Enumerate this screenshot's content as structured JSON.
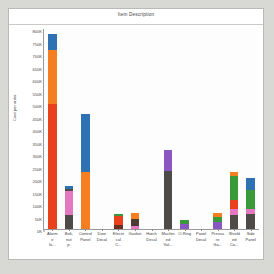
{
  "chart_data": {
    "type": "bar",
    "stacked": true,
    "title": "Item Description",
    "xlabel": "",
    "ylabel": "Cost per order",
    "ylim": [
      0,
      800000
    ],
    "ytick_labels": [
      "0K",
      "50K",
      "100K",
      "150K",
      "200K",
      "250K",
      "300K",
      "350K",
      "400K",
      "450K",
      "500K",
      "550K",
      "600K",
      "650K",
      "700K",
      "750K",
      "800K"
    ],
    "ytick_values": [
      0,
      50000,
      100000,
      150000,
      200000,
      250000,
      300000,
      350000,
      400000,
      450000,
      500000,
      550000,
      600000,
      650000,
      700000,
      750000,
      800000
    ],
    "grid": false,
    "legend": "none",
    "categories": [
      "Alarm e fa...",
      "Bolt, nut p.",
      "Control Panel",
      "Door Decal",
      "Electri cal C...",
      "Gasket",
      "Hatch Decal",
      "Machin ed Val...",
      "O-Ring",
      "Panel Decal",
      "Pressu re Ga...",
      "Shield ed Ca...",
      "Side Panel"
    ],
    "colors": {
      "blue": "#2f72b4",
      "orange": "#f57f20",
      "red": "#e8411c",
      "pink": "#e377c2",
      "gray": "#4d4a47",
      "green": "#3a9a3a",
      "purple": "#8a56c2",
      "teal": "#17becf"
    },
    "bars": [
      {
        "category": "Alarm e fa...",
        "total": 780000,
        "segments": [
          {
            "color": "#e8411c",
            "value": 500000
          },
          {
            "color": "#f57f20",
            "value": 215000
          },
          {
            "color": "#2f72b4",
            "value": 65000
          }
        ]
      },
      {
        "category": "Bolt, nut p.",
        "total": 172000,
        "segments": [
          {
            "color": "#4d4a47",
            "value": 55000
          },
          {
            "color": "#e377c2",
            "value": 98000
          },
          {
            "color": "#4d4a47",
            "value": 8000
          },
          {
            "color": "#2f72b4",
            "value": 11000
          }
        ]
      },
      {
        "category": "Control Panel",
        "total": 462000,
        "segments": [
          {
            "color": "#f57f20",
            "value": 228000
          },
          {
            "color": "#2f72b4",
            "value": 234000
          }
        ]
      },
      {
        "category": "Door Decal",
        "total": 0,
        "segments": []
      },
      {
        "category": "Electri cal C...",
        "total": 61000,
        "segments": [
          {
            "color": "#6b2f22",
            "value": 18000
          },
          {
            "color": "#e8411c",
            "value": 34000
          },
          {
            "color": "#3a9a3a",
            "value": 9000
          }
        ]
      },
      {
        "category": "Gasket",
        "total": 66000,
        "segments": [
          {
            "color": "#e377c2",
            "value": 14000
          },
          {
            "color": "#4d3a32",
            "value": 26000
          },
          {
            "color": "#f57f20",
            "value": 26000
          }
        ]
      },
      {
        "category": "Hatch Decal",
        "total": 0,
        "segments": []
      },
      {
        "category": "Machin ed Val...",
        "total": 318000,
        "segments": [
          {
            "color": "#4d4a47",
            "value": 234000
          },
          {
            "color": "#8a56c2",
            "value": 84000
          }
        ]
      },
      {
        "category": "O-Ring",
        "total": 38000,
        "segments": [
          {
            "color": "#8a56c2",
            "value": 22000
          },
          {
            "color": "#3a9a3a",
            "value": 16000
          }
        ]
      },
      {
        "category": "Panel Decal",
        "total": 0,
        "segments": []
      },
      {
        "category": "Pressu re Ga...",
        "total": 63000,
        "segments": [
          {
            "color": "#8a56c2",
            "value": 28000
          },
          {
            "color": "#3a9a3a",
            "value": 22000
          },
          {
            "color": "#f57f20",
            "value": 13000
          }
        ]
      },
      {
        "category": "Shield ed Ca...",
        "total": 228000,
        "segments": [
          {
            "color": "#4d4a47",
            "value": 57000
          },
          {
            "color": "#e377c2",
            "value": 24000
          },
          {
            "color": "#e8411c",
            "value": 34000
          },
          {
            "color": "#3a9a3a",
            "value": 99000
          },
          {
            "color": "#f57f20",
            "value": 14000
          }
        ]
      },
      {
        "category": "Side Panel",
        "total": 205000,
        "segments": [
          {
            "color": "#4d4a47",
            "value": 62000
          },
          {
            "color": "#e377c2",
            "value": 20000
          },
          {
            "color": "#3a9a3a",
            "value": 73000
          },
          {
            "color": "#2f72b4",
            "value": 50000
          }
        ]
      }
    ]
  }
}
